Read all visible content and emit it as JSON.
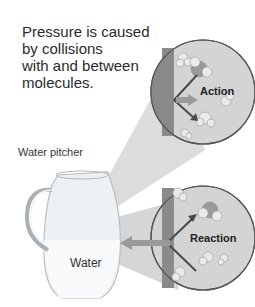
{
  "caption": {
    "lines": [
      "Pressure is caused",
      "by collisions",
      "with and between",
      "molecules."
    ]
  },
  "labels": {
    "pitcher": "Water pitcher",
    "water": "Water",
    "action": "Action",
    "reaction": "Reaction"
  },
  "colors": {
    "callout_fill": "#d4d4d4",
    "wall": "#8a8a8a",
    "beam": "#cfcfcf",
    "arrow_light": "#9a9a9a",
    "arrow_dark": "#4a4a4a",
    "text": "#2b2b2b"
  }
}
